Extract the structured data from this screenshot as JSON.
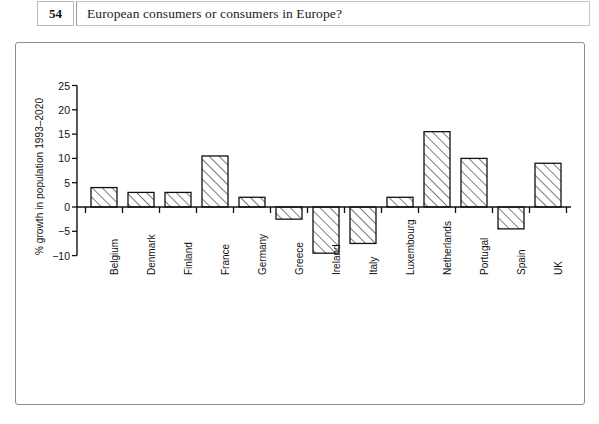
{
  "header": {
    "page_number": "54",
    "running_head": "European consumers or consumers in Europe?"
  },
  "chart_data": {
    "type": "bar",
    "title": "",
    "xlabel": "",
    "ylabel": "% growth in population 1993–2020",
    "ylim": [
      -10,
      25
    ],
    "yticks": [
      25,
      20,
      15,
      10,
      5,
      0,
      -5,
      -10
    ],
    "ytick_labels": [
      "25",
      "20",
      "15",
      "10",
      "5",
      "0",
      "−5",
      "−10"
    ],
    "grid": false,
    "legend": "none",
    "bar_style": "diagonal-hatch",
    "categories": [
      "Belgium",
      "Denmark",
      "Finland",
      "France",
      "Germany",
      "Greece",
      "Ireland",
      "Italy",
      "Luxembourg",
      "Netherlands",
      "Portugal",
      "Spain",
      "UK"
    ],
    "values": [
      4,
      3,
      3,
      10.5,
      2,
      -2.5,
      -9.5,
      -7.5,
      2,
      15.5,
      10,
      -4.5,
      9
    ]
  }
}
